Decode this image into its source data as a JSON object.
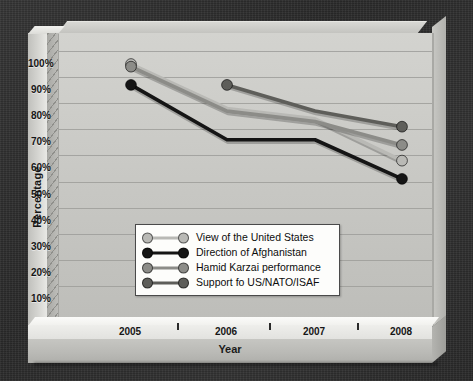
{
  "chart_data": {
    "type": "line",
    "title": "",
    "xlabel": "Year",
    "ylabel": "Percentage",
    "categories": [
      "2005",
      "2006",
      "2007",
      "2008"
    ],
    "x": [
      2005,
      2006,
      2007,
      2008
    ],
    "ylim": [
      0,
      100
    ],
    "ytick_labels": [
      "0%",
      "10%",
      "20%",
      "30%",
      "40%",
      "50%",
      "60%",
      "70%",
      "80%",
      "90%",
      "100%"
    ],
    "ytick_values": [
      0,
      10,
      20,
      30,
      40,
      50,
      60,
      70,
      80,
      90,
      100
    ],
    "xtick_labels": [
      "2005",
      "2006",
      "2007",
      "2008"
    ],
    "grid": true,
    "legend_position": "center-left-inside",
    "marker_policy": "endpoints-only",
    "series": [
      {
        "name": "View of the United States",
        "color": "#b9b9b5",
        "values": [
          95,
          78,
          74,
          58
        ]
      },
      {
        "name": "Direction of Afghanistan",
        "color": "#151515",
        "values": [
          87,
          66,
          66,
          51
        ]
      },
      {
        "name": "Hamid Karzai performance",
        "color": "#8c8c88",
        "values": [
          94,
          77,
          73,
          64
        ]
      },
      {
        "name": "Support fo US/NATO/ISAF",
        "color": "#5e5e5a",
        "values": [
          null,
          87,
          77,
          71
        ]
      }
    ]
  },
  "axis": {
    "y_title": "Percentage",
    "x_title": "Year"
  },
  "legend": {
    "items": [
      {
        "label": "View of the United States",
        "color": "#b9b9b5"
      },
      {
        "label": "Direction of Afghanistan",
        "color": "#151515"
      },
      {
        "label": "Hamid Karzai performance",
        "color": "#8c8c88"
      },
      {
        "label": "Support fo US/NATO/ISAF",
        "color": "#5e5e5a"
      }
    ]
  },
  "colors": {
    "backdrop": "#2f2f2f",
    "plot_wall": "#c8c8c4",
    "gridline": "#9e9e9a",
    "plinth": "#b9b9b5",
    "legend_background": "#fdfdfb",
    "legend_border": "#4a4a4a"
  }
}
